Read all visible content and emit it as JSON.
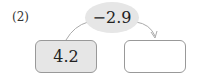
{
  "problem": {
    "label": "(2)",
    "operation": "−2.9",
    "input_value": "4.2",
    "output_value": "",
    "arrow_color": "#aaaaaa",
    "input_box_fill": "#e6e6e6",
    "output_box_fill": "#ffffff"
  }
}
